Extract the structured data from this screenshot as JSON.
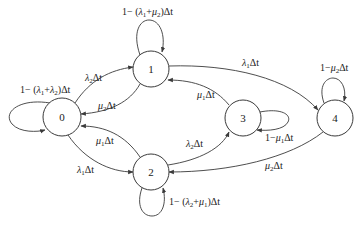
{
  "diagram": {
    "colors": {
      "stroke": "#3a3a3a",
      "text": "#222222",
      "background": "#ffffff"
    },
    "nodes": [
      {
        "id": "0",
        "label": "0",
        "cx": 62,
        "cy": 117,
        "r": 19
      },
      {
        "id": "1",
        "label": "1",
        "cx": 151,
        "cy": 69,
        "r": 18
      },
      {
        "id": "2",
        "label": "2",
        "cx": 151,
        "cy": 172,
        "r": 18
      },
      {
        "id": "3",
        "label": "3",
        "cx": 243,
        "cy": 118,
        "r": 18
      },
      {
        "id": "4",
        "label": "4",
        "cx": 335,
        "cy": 118,
        "r": 18
      }
    ],
    "edges": [
      {
        "from": "0",
        "to": "0",
        "label": "1−(λ1+λ2)Δt"
      },
      {
        "from": "0",
        "to": "1",
        "label": "λ2Δt"
      },
      {
        "from": "1",
        "to": "0",
        "label": "μ2Δt"
      },
      {
        "from": "0",
        "to": "2",
        "label": "λ1Δt"
      },
      {
        "from": "2",
        "to": "0",
        "label": "μ1Δt"
      },
      {
        "from": "1",
        "to": "1",
        "label": "1−(λ1+μ2)Δt"
      },
      {
        "from": "1",
        "to": "4",
        "label": "λ1Δt"
      },
      {
        "from": "3",
        "to": "1",
        "label": "μ1Δt"
      },
      {
        "from": "2",
        "to": "3",
        "label": "λ2Δt"
      },
      {
        "from": "3",
        "to": "3",
        "label": "1−μ1Δt"
      },
      {
        "from": "4",
        "to": "4",
        "label": "1−μ2Δt"
      },
      {
        "from": "4",
        "to": "2",
        "label": "μ2Δt"
      },
      {
        "from": "2",
        "to": "2",
        "label": "1−(λ2+μ1)Δt"
      }
    ],
    "labels": {
      "self_0": {
        "pre": "1− (",
        "l1": "λ",
        "s1": "1",
        "plus": "+",
        "l2": "λ",
        "s2": "2",
        "post": ")Δt"
      },
      "self_1": {
        "pre": "1− (",
        "l1": "λ",
        "s1": "1",
        "plus": "+",
        "l2": "μ",
        "s2": "2",
        "post": ")Δt"
      },
      "self_2": {
        "pre": "1− (",
        "l1": "λ",
        "s1": "2",
        "plus": "+",
        "l2": "μ",
        "s2": "1",
        "post": ")Δt"
      },
      "self_3": {
        "pre": "1−",
        "l1": "μ",
        "s1": "1",
        "post": "Δt"
      },
      "self_4": {
        "pre": "1−",
        "l1": "μ",
        "s1": "2",
        "post": "Δt"
      },
      "e01": {
        "g": "λ",
        "s": "2",
        "post": "Δt"
      },
      "e10": {
        "g": "μ",
        "s": "2",
        "post": "Δt"
      },
      "e02": {
        "g": "λ",
        "s": "1",
        "post": "Δt"
      },
      "e20": {
        "g": "μ",
        "s": "1",
        "post": "Δt"
      },
      "e14": {
        "g": "λ",
        "s": "1",
        "post": "Δt"
      },
      "e31": {
        "g": "μ",
        "s": "1",
        "post": "Δt"
      },
      "e23": {
        "g": "λ",
        "s": "2",
        "post": "Δt"
      },
      "e42": {
        "g": "μ",
        "s": "2",
        "post": "Δt"
      }
    }
  }
}
